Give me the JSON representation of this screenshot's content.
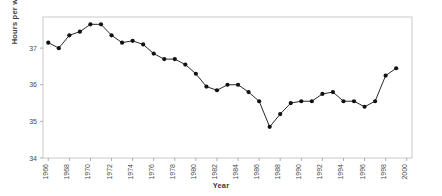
{
  "chart_data": {
    "type": "line",
    "title": "",
    "xlabel": "Year",
    "ylabel": "Hours per week",
    "grid": false,
    "legend": false,
    "xlim": [
      1965.5,
      2000.5
    ],
    "ylim": [
      34.0,
      37.85
    ],
    "x_tick_labels": [
      "1966",
      "1968",
      "1970",
      "1972",
      "1974",
      "1976",
      "1978",
      "1980",
      "1982",
      "1984",
      "1986",
      "1988",
      "1990",
      "1992",
      "1994",
      "1996",
      "1998",
      "2000"
    ],
    "x_tick_values": [
      1966,
      1968,
      1970,
      1972,
      1974,
      1976,
      1978,
      1980,
      1982,
      1984,
      1986,
      1988,
      1990,
      1992,
      1994,
      1996,
      1998,
      2000
    ],
    "y_tick_labels": [
      "34",
      "35",
      "36",
      "37"
    ],
    "y_tick_values": [
      34,
      35,
      36,
      37
    ],
    "series": [
      {
        "name": "Hours per week",
        "marker": "filled-circle",
        "color": "#111111",
        "x": [
          1966,
          1967,
          1968,
          1969,
          1970,
          1971,
          1972,
          1973,
          1974,
          1975,
          1976,
          1977,
          1978,
          1979,
          1980,
          1981,
          1982,
          1983,
          1984,
          1985,
          1986,
          1987,
          1988,
          1989,
          1990,
          1991,
          1992,
          1993,
          1994,
          1995,
          1996,
          1997,
          1998,
          1999
        ],
        "y": [
          37.15,
          37.0,
          37.35,
          37.45,
          37.65,
          37.65,
          37.35,
          37.15,
          37.2,
          37.1,
          36.85,
          36.7,
          36.7,
          36.55,
          36.3,
          35.95,
          35.85,
          36.0,
          36.0,
          35.8,
          35.55,
          34.85,
          35.2,
          35.5,
          35.55,
          35.55,
          35.75,
          35.8,
          35.55,
          35.55,
          35.4,
          35.55,
          36.25,
          36.45
        ]
      }
    ]
  },
  "axes": {
    "ylabel_text": "Hours per week",
    "xlabel_text": "Year"
  }
}
